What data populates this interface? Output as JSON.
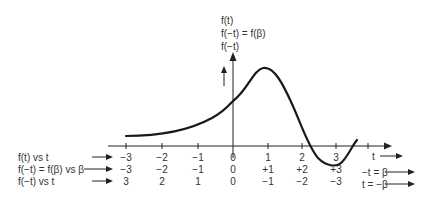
{
  "figure": {
    "y_axis_labels": [
      "f(t)",
      "f(−t) = f(β)",
      "f(−t)"
    ],
    "x_axis_label": "t",
    "right_labels": [
      "−t = β",
      "t = −β"
    ],
    "row_labels": [
      "f(t) vs t",
      "f(−t) = f(β) vs β",
      "f(−t) vs t"
    ],
    "rows": [
      [
        "−3",
        "−2",
        "−1",
        "0",
        "1",
        "2",
        "3"
      ],
      [
        "−3",
        "−2",
        "−1",
        "0",
        "+1",
        "+2",
        "+3"
      ],
      [
        "3",
        "2",
        "1",
        "0",
        "−1",
        "−2",
        "−3"
      ]
    ],
    "colors": {
      "ink": "#222222",
      "background": "#ffffff"
    }
  }
}
